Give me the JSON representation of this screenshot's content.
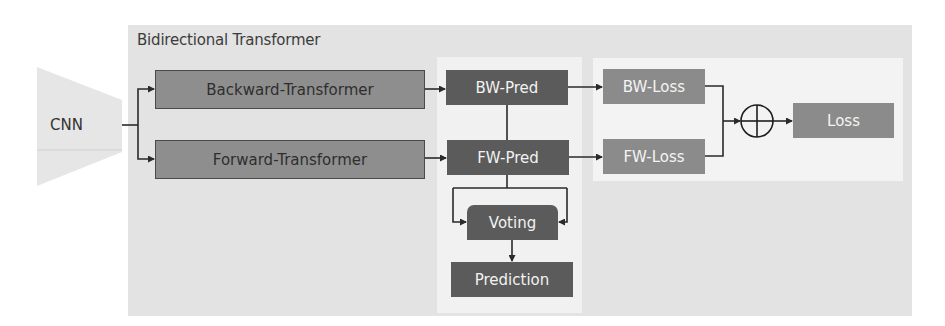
{
  "diagram": {
    "container": {
      "title": "Bidirectional Transformer"
    },
    "input": {
      "label": "CNN"
    },
    "transformers": [
      {
        "id": "backward",
        "label": "Backward-Transformer"
      },
      {
        "id": "forward",
        "label": "Forward-Transformer"
      }
    ],
    "predictions": [
      {
        "id": "bw_pred",
        "label": "BW-Pred"
      },
      {
        "id": "fw_pred",
        "label": "FW-Pred"
      }
    ],
    "voting": {
      "label": "Voting"
    },
    "prediction": {
      "label": "Prediction"
    },
    "losses": [
      {
        "id": "bw_loss",
        "label": "BW-Loss"
      },
      {
        "id": "fw_loss",
        "label": "FW-Loss"
      }
    ],
    "sum_operator": {
      "symbol": "⊕",
      "name": "sum"
    },
    "total_loss": {
      "label": "Loss"
    },
    "colors": {
      "container_bg": "#e3e3e3",
      "transformer_fill": "#8e8e8e",
      "pred_fill": "#5b5b5b",
      "loss_fill": "#8b8b8b",
      "panel_bg": "#f2f2f2"
    },
    "edges": [
      [
        "CNN",
        "Backward-Transformer"
      ],
      [
        "CNN",
        "Forward-Transformer"
      ],
      [
        "Backward-Transformer",
        "BW-Pred"
      ],
      [
        "Forward-Transformer",
        "FW-Pred"
      ],
      [
        "BW-Pred",
        "BW-Loss"
      ],
      [
        "FW-Pred",
        "FW-Loss"
      ],
      [
        "BW-Pred",
        "Voting"
      ],
      [
        "FW-Pred",
        "Voting"
      ],
      [
        "Voting",
        "Prediction"
      ],
      [
        "BW-Loss",
        "⊕"
      ],
      [
        "FW-Loss",
        "⊕"
      ],
      [
        "⊕",
        "Loss"
      ]
    ]
  }
}
